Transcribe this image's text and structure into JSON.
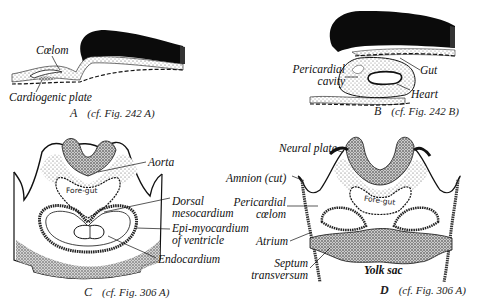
{
  "figure": {
    "panels": [
      {
        "id": "A",
        "letter": "A",
        "reference": "(cf. Fig. 242 A)",
        "labels": [
          "Cœlom",
          "Cardiogenic plate"
        ]
      },
      {
        "id": "B",
        "letter": "B",
        "reference": "(cf. Fig. 242 B)",
        "labels": [
          "Pericardial cavity",
          "Gut",
          "Heart"
        ]
      },
      {
        "id": "C",
        "letter": "C",
        "reference": "(cf. Fig. 306 A)",
        "inner_label": "Fore-gut",
        "labels": [
          "Aorta",
          "Dorsal mesocardium",
          "Epi-myocardium of ventricle",
          "Endocardium"
        ]
      },
      {
        "id": "D",
        "letter": "D",
        "reference": "(cf. Fig. 306 A)",
        "inner_label": "Fore-gut",
        "labels": [
          "Neural plate",
          "Amnion (cut)",
          "Pericardial cœlom",
          "Atrium",
          "Septum transversum",
          "Yolk sac"
        ]
      }
    ]
  },
  "labels": {
    "a_coelom": "Cœlom",
    "a_cardiogenic": "Cardiogenic plate",
    "b_pericardial_1": "Pericardial",
    "b_pericardial_2": "cavity",
    "b_gut": "Gut",
    "b_heart": "Heart",
    "c_foregut": "Fore-gut",
    "c_aorta": "Aorta",
    "c_dorsal_1": "Dorsal",
    "c_dorsal_2": "mesocardium",
    "c_epi_1": "Epi-myocardium",
    "c_epi_2": "of ventricle",
    "c_endo": "Endocardium",
    "d_neural": "Neural plate",
    "d_amnion": "Amnion (cut)",
    "d_peri_1": "Pericardial",
    "d_peri_2": "cœlom",
    "d_atrium": "Atrium",
    "d_septum_1": "Septum",
    "d_septum_2": "transversum",
    "d_yolk": "Yolk sac",
    "d_foregut": "Fore-gut"
  },
  "captions": {
    "a_letter": "A",
    "a_ref": "(cf. Fig. 242 A)",
    "b_letter": "B",
    "b_ref": "(cf. Fig. 242 B)",
    "c_letter": "C",
    "c_ref": "(cf. Fig. 306 A)",
    "d_letter": "D",
    "d_ref": "(cf. Fig. 306 A)"
  }
}
